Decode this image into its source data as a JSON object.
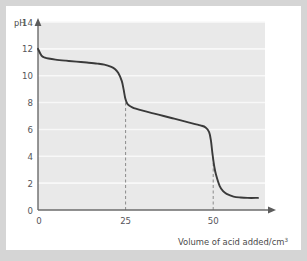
{
  "chart_data": {
    "type": "line",
    "title": "",
    "xlabel": "Volume of acid added/cm",
    "xlabel_superscript": "3",
    "ylabel": "pH",
    "xlim": [
      0,
      65
    ],
    "ylim": [
      0,
      14
    ],
    "xticks": [
      0,
      25,
      50
    ],
    "xtick_labels": [
      "0",
      "25",
      "50"
    ],
    "yticks": [
      0,
      2,
      4,
      6,
      8,
      10,
      12,
      14
    ],
    "ytick_labels": [
      "0",
      "2",
      "4",
      "6",
      "8",
      "10",
      "12",
      "14"
    ],
    "grid": "horizontal",
    "legend": "none",
    "series": [
      {
        "name": "titration-curve",
        "color": "#3a3a3a",
        "x": [
          0,
          1,
          2,
          3,
          5,
          8,
          11,
          14,
          17,
          19,
          21,
          22,
          23,
          24,
          24.5,
          25,
          25.5,
          26,
          27,
          28,
          30,
          33,
          36,
          39,
          42,
          45,
          46.5,
          48,
          49,
          49.5,
          50,
          50.5,
          51,
          52,
          53,
          54,
          56,
          58,
          60,
          63
        ],
        "y": [
          12.0,
          11.5,
          11.35,
          11.28,
          11.2,
          11.12,
          11.05,
          10.98,
          10.9,
          10.82,
          10.65,
          10.5,
          10.2,
          9.6,
          9.0,
          8.3,
          7.95,
          7.8,
          7.65,
          7.55,
          7.4,
          7.2,
          7.0,
          6.8,
          6.6,
          6.4,
          6.3,
          6.15,
          5.8,
          5.2,
          4.1,
          3.2,
          2.6,
          1.8,
          1.4,
          1.2,
          1.0,
          0.93,
          0.9,
          0.9
        ]
      }
    ],
    "annotations": [
      {
        "name": "first-equivalence-dashed-line",
        "type": "vertical-dashed",
        "x": 25,
        "y_from": 0,
        "y_to": 8.3
      },
      {
        "name": "second-equivalence-dashed-line",
        "type": "vertical-dashed",
        "x": 50,
        "y_from": 0,
        "y_to": 4.1
      }
    ],
    "colors": {
      "plot_background": "#e9e9e9",
      "gridline": "#f7f7f7",
      "axis": "#6b6b6b",
      "curve": "#3a3a3a",
      "dashed": "#7a7a7a",
      "card_background": "#ffffff",
      "page_background": "#d5d5d5"
    }
  }
}
